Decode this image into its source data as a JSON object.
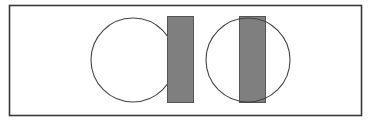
{
  "diagram": {
    "width": 377,
    "height": 122,
    "frame": {
      "x": 9.5,
      "y": 5.5,
      "width": 352,
      "height": 110,
      "stroke": "#3a3a3a",
      "stroke_width": 1.6
    },
    "groups": [
      {
        "name": "left-pair",
        "circle": {
          "cx": 133,
          "cy": 60,
          "r": 42,
          "stroke": "#444444",
          "fill": "none"
        },
        "rect": {
          "x": 167.5,
          "y": 16.5,
          "width": 26,
          "height": 86,
          "fill": "#7f7f7f",
          "stroke": "#555555"
        }
      },
      {
        "name": "right-pair",
        "circle": {
          "cx": 248,
          "cy": 60,
          "r": 42,
          "stroke": "#444444",
          "fill": "none"
        },
        "rect": {
          "x": 239.5,
          "y": 16.5,
          "width": 26,
          "height": 86,
          "fill": "#7f7f7f",
          "stroke": "#555555"
        }
      }
    ],
    "colors": {
      "background": "#ffffff",
      "frame": "#3a3a3a",
      "circle_stroke": "#444444",
      "rect_fill": "#7f7f7f",
      "rect_stroke": "#555555"
    }
  }
}
